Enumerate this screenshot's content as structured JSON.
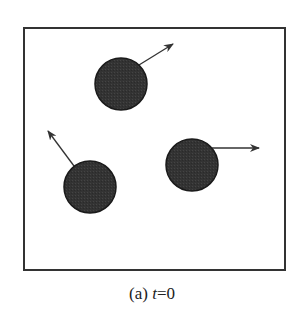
{
  "figure": {
    "caption": {
      "label": "(a)",
      "variable": "t",
      "equals": "=0"
    },
    "box": {
      "x": 24,
      "y": 28,
      "width": 261,
      "height": 242,
      "stroke": "#333333"
    },
    "colors": {
      "particle_fill": "#333333",
      "particle_stroke": "#1a1a1a",
      "arrow": "#333333"
    },
    "particles": [
      {
        "name": "particle-top",
        "cx": 121,
        "cy": 84,
        "r": 26,
        "velocity": {
          "x1": 139,
          "y1": 65,
          "x2": 173,
          "y2": 44
        }
      },
      {
        "name": "particle-bottom-left",
        "cx": 90,
        "cy": 187,
        "r": 26,
        "velocity": {
          "x1": 74,
          "y1": 166,
          "x2": 48,
          "y2": 131
        }
      },
      {
        "name": "particle-right",
        "cx": 192,
        "cy": 165,
        "r": 26,
        "velocity": {
          "x1": 212,
          "y1": 148,
          "x2": 259,
          "y2": 148
        }
      }
    ]
  }
}
